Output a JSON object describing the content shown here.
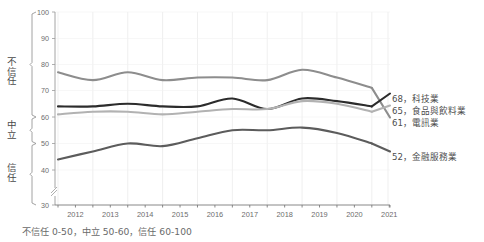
{
  "partial_top_text": "",
  "axis": {
    "y_ticks": [
      100,
      90,
      80,
      70,
      60,
      50,
      40,
      30
    ],
    "y_min": 30,
    "y_max": 100,
    "y_break_at": 35,
    "x_ticks": [
      "2012",
      "2013",
      "2014",
      "2015",
      "2016",
      "2017",
      "2018",
      "2019",
      "2020",
      "2021"
    ]
  },
  "brackets": [
    {
      "label": "不信任",
      "from": 100,
      "to": 60
    },
    {
      "label": "中立",
      "from": 60,
      "to": 50
    },
    {
      "label": "信任",
      "from": 50,
      "to": 30
    }
  ],
  "caption": "不信任 0-50，中立 50-60，信任 60-100",
  "series_labels": [
    {
      "text": "68，科技業",
      "color": "#2c2c2c"
    },
    {
      "text": "65，食品與飲料業",
      "color": "#b2b2b2"
    },
    {
      "text": "61，電訊業",
      "color": "#8d8d8d"
    },
    {
      "text": "52，金融服務業",
      "color": "#5c5c5c"
    }
  ],
  "chart_data": {
    "type": "line",
    "title": "",
    "xlabel": "",
    "ylabel": "",
    "x": [
      "2012",
      "2013",
      "2014",
      "2015",
      "2016",
      "2017",
      "2018",
      "2019",
      "2020",
      "2021"
    ],
    "ylim": [
      30,
      100
    ],
    "xlim": [
      "2012",
      "2021"
    ],
    "grid": true,
    "legend_position": "right-inline",
    "y_axis_bands": {
      "distrust": "60-100",
      "neutral": "50-60",
      "trust": "30-50"
    },
    "series": [
      {
        "name": "電訊業",
        "color": "#8d8d8d",
        "end_value": 61,
        "values": [
          77,
          74,
          77,
          74,
          75,
          75,
          74,
          78,
          75,
          71
        ]
      },
      {
        "name": "科技業",
        "color": "#2c2c2c",
        "end_value": 68,
        "values": [
          64,
          64,
          65,
          64,
          64,
          67,
          63,
          67,
          66,
          64
        ]
      },
      {
        "name": "食品與飲料業",
        "color": "#b2b2b2",
        "end_value": 65,
        "values": [
          61,
          62,
          62,
          61,
          62,
          63,
          63,
          66,
          65,
          62
        ]
      },
      {
        "name": "金融服務業",
        "color": "#5c5c5c",
        "end_value": 52,
        "values": [
          44,
          47,
          50,
          49,
          52,
          55,
          55,
          56,
          54,
          50
        ]
      }
    ]
  }
}
